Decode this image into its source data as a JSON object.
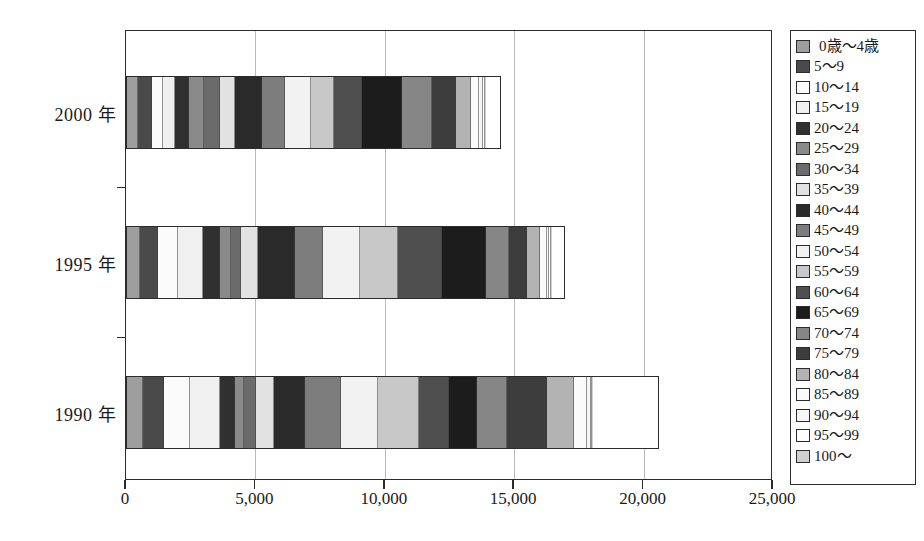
{
  "chart_data": {
    "type": "bar",
    "orientation": "horizontal",
    "stacked": true,
    "title": "",
    "subtitle": "",
    "xlabel": "",
    "ylabel": "",
    "xlim": [
      0,
      25000
    ],
    "ylim": null,
    "grid": true,
    "legend_position": "right",
    "x_ticks": [
      {
        "value": 0,
        "label": "0"
      },
      {
        "value": 5000,
        "label": "5,000"
      },
      {
        "value": 10000,
        "label": "10,000"
      },
      {
        "value": 15000,
        "label": "15,000"
      },
      {
        "value": 20000,
        "label": "20,000"
      },
      {
        "value": 25000,
        "label": "25,000"
      }
    ],
    "categories": [
      "2000 年",
      "1995 年",
      "1990 年"
    ],
    "category_order_top_to_bottom": [
      "2000 年",
      "1995 年",
      "1990 年"
    ],
    "series": [
      {
        "name": "0歳〜4歳",
        "color": "#9e9e9e",
        "values": [
          420,
          520,
          620
        ]
      },
      {
        "name": "5〜9",
        "color": "#4a4a4a",
        "values": [
          560,
          700,
          800
        ]
      },
      {
        "name": "10〜14",
        "color": "#fbfbfb",
        "values": [
          420,
          760,
          1040
        ]
      },
      {
        "name": "15〜19",
        "color": "#f0f0f0",
        "values": [
          460,
          980,
          1130
        ]
      },
      {
        "name": "20〜24",
        "color": "#303030",
        "values": [
          560,
          640,
          600
        ]
      },
      {
        "name": "25〜29",
        "color": "#8a8a8a",
        "values": [
          560,
          440,
          340
        ]
      },
      {
        "name": "30〜34",
        "color": "#6b6b6b",
        "values": [
          620,
          400,
          470
        ]
      },
      {
        "name": "35〜39",
        "color": "#e2e2e2",
        "values": [
          600,
          640,
          700
        ]
      },
      {
        "name": "40〜44",
        "color": "#2a2a2a",
        "values": [
          1060,
          1430,
          1190
        ]
      },
      {
        "name": "45〜49",
        "color": "#7d7d7d",
        "values": [
          900,
          1100,
          1400
        ]
      },
      {
        "name": "50〜54",
        "color": "#f2f2f2",
        "values": [
          1010,
          1430,
          1430
        ]
      },
      {
        "name": "55〜59",
        "color": "#c8c8c8",
        "values": [
          880,
          1500,
          1600
        ]
      },
      {
        "name": "60〜64",
        "color": "#4f4f4f",
        "values": [
          1080,
          1700,
          1160
        ]
      },
      {
        "name": "65〜69",
        "color": "#1c1c1c",
        "values": [
          1550,
          1700,
          1080
        ]
      },
      {
        "name": "70〜74",
        "color": "#868686",
        "values": [
          1180,
          900,
          1190
        ]
      },
      {
        "name": "75〜79",
        "color": "#3d3d3d",
        "values": [
          920,
          700,
          1550
        ]
      },
      {
        "name": "80〜84",
        "color": "#b3b3b3",
        "values": [
          580,
          480,
          1040
        ]
      },
      {
        "name": "85〜89",
        "color": "#fafafa",
        "values": [
          330,
          270,
          520
        ]
      },
      {
        "name": "90〜94",
        "color": "#f6f6f6",
        "values": [
          150,
          110,
          130
        ]
      },
      {
        "name": "95〜99",
        "color": "#fdfdfd",
        "values": [
          60,
          50,
          60
        ]
      },
      {
        "name": "100〜",
        "color": "#cfcfcf",
        "values": [
          30,
          25,
          30
        ]
      }
    ],
    "totals": [
      14490,
      16975,
      20580
    ]
  },
  "axes": {
    "y_tick_labels": [
      "2000 年",
      "1995 年",
      "1990 年"
    ],
    "x_tick_labels": [
      "0",
      "5,000",
      "10,000",
      "15,000",
      "20,000",
      "25,000"
    ]
  },
  "legend": {
    "items": [
      "0歳〜4歳",
      "5〜9",
      "10〜14",
      "15〜19",
      "20〜24",
      "25〜29",
      "30〜34",
      "35〜39",
      "40〜44",
      "45〜49",
      "50〜54",
      "55〜59",
      "60〜64",
      "65〜69",
      "70〜74",
      "75〜79",
      "80〜84",
      "85〜89",
      "90〜94",
      "95〜99",
      "100〜"
    ]
  },
  "colors": {
    "frame": "#2b2b2b",
    "gridline": "#b9b9b9",
    "background": "#ffffff",
    "text": "#1a1a1a"
  }
}
